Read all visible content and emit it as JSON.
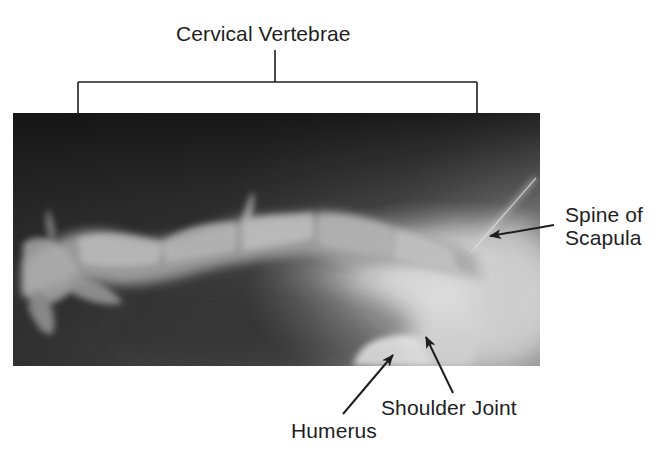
{
  "figure": {
    "type": "annotated-radiograph",
    "colors": {
      "background": "#ffffff",
      "label_text": "#1e1e1e",
      "annotation_lines": "#1e1e1e",
      "xray_dark": "#151515",
      "xray_mid": "#5e5e5e",
      "xray_bright": "#e8e8e8"
    }
  },
  "labels": {
    "cervical_vertebrae": "Cervical Vertebrae",
    "spine_of_scapula_line1": "Spine of",
    "spine_of_scapula_line2": "Scapula",
    "shoulder_joint": "Shoulder Joint",
    "humerus": "Humerus"
  },
  "annotations": {
    "bracket": {
      "target": "Cervical Vertebrae",
      "stem": {
        "x": 275,
        "y1": 50,
        "y2": 82
      },
      "bar": {
        "y": 82,
        "x1": 78,
        "x2": 477
      },
      "legs_bottom_y": 114
    },
    "arrows": [
      {
        "target": "Spine of Scapula",
        "tail": [
          554,
          225
        ],
        "tip": [
          490,
          236
        ]
      },
      {
        "target": "Shoulder Joint",
        "tail": [
          453,
          393
        ],
        "tip": [
          426,
          337
        ]
      },
      {
        "target": "Humerus",
        "tail": [
          343,
          414
        ],
        "tip": [
          393,
          355
        ]
      }
    ]
  }
}
